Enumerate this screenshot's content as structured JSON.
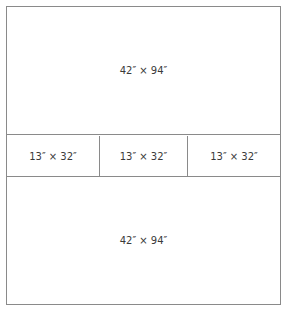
{
  "diagram": {
    "top_panel": {
      "label": "42″ × 94″"
    },
    "middle_row": [
      {
        "label": "13″ × 32″"
      },
      {
        "label": "13″ × 32″"
      },
      {
        "label": "13″ × 32″"
      }
    ],
    "bottom_panel": {
      "label": "42″ × 94″"
    },
    "colors": {
      "line": "#8a8a8a",
      "text": "#3a3a3a",
      "background": "#ffffff"
    }
  }
}
